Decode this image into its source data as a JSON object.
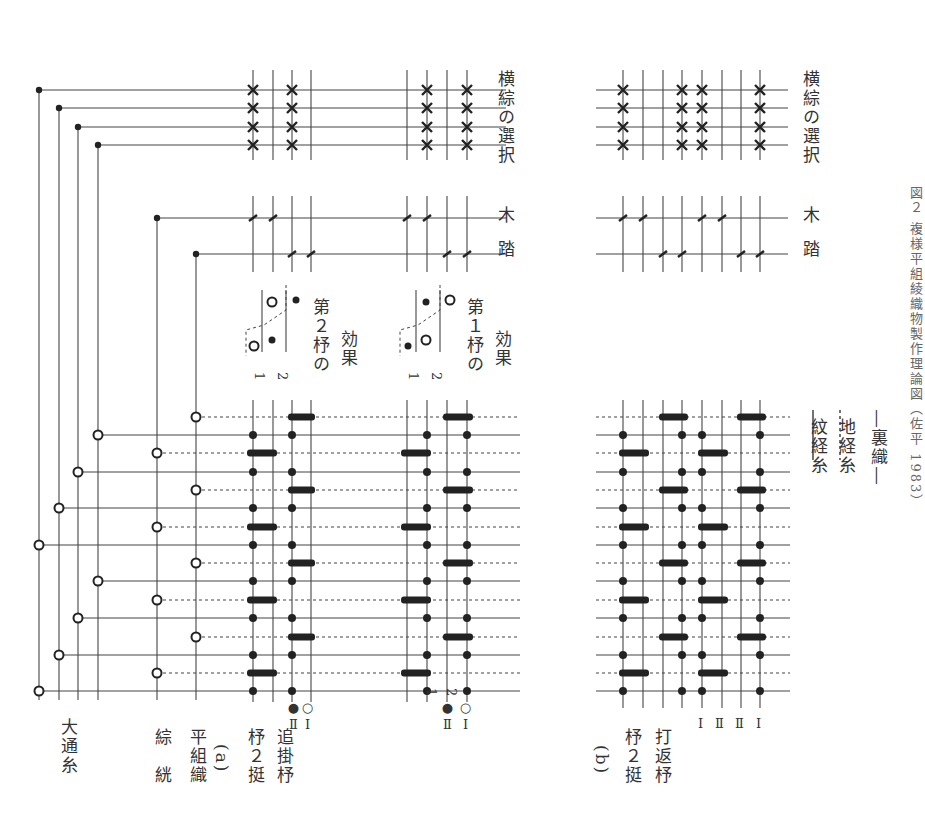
{
  "figure": {
    "caption": "図２ 複様平組綾織物製作理論図（佐平 1983）",
    "orientation": "rotated 90° clockwise"
  },
  "labels": {
    "odori_ito": "大通糸",
    "sou_sou": "綜　絖",
    "hira_soshiki": "平組織",
    "part_a": "(a)",
    "hi2tei_a": "杼２挺",
    "oikake_hi": "追掛杼",
    "mark_II_filled": "●Ⅱ",
    "mark_I_open": "○Ⅰ",
    "part_b": "(b)",
    "hi2tei_b": "杼２挺",
    "uchikaeshi_hi": "打返杼",
    "yokosou_select_1": "横綜の選択",
    "yokosou_select_2": "横綜の選択",
    "fumiki_1a": "踏",
    "fumiki_1b": "木",
    "fumiki_2a": "踏",
    "fumiki_2b": "木",
    "effect_2": "第２杼の",
    "effect_2b": "効果",
    "effect_1": "第１杼の",
    "effect_1b": "効果",
    "shed_1": "1",
    "shed_2": "2",
    "col_1": "1",
    "col_2": "2",
    "b_cols": [
      "Ⅰ",
      "Ⅱ",
      "Ⅱ",
      "Ⅰ"
    ]
  },
  "legend": {
    "solid": "紋経糸",
    "dotted": "地経糸",
    "back_weave": "―裏織―"
  },
  "colors": {
    "ink": "#222222",
    "line": "#444444",
    "background": "#ffffff"
  },
  "diagram": {
    "warp_rows_y": [
      417,
      435,
      453,
      472,
      490,
      508,
      527,
      545,
      563,
      581,
      600,
      618,
      637,
      655,
      673,
      691
    ],
    "warp_row_type": [
      "d",
      "s",
      "d",
      "s",
      "d",
      "s",
      "d",
      "s",
      "d",
      "s",
      "d",
      "s",
      "d",
      "s",
      "d",
      "s"
    ],
    "draw_lines_x": [
      39,
      59,
      78,
      98
    ],
    "draw_lines_top_y": [
      90,
      108,
      127,
      145
    ],
    "heddle_x": [
      157,
      196
    ],
    "grid_a1_x": [
      253,
      273,
      292,
      311
    ],
    "grid_a2_x": [
      407,
      427,
      447,
      467
    ],
    "grid_b_x": [
      623,
      643,
      663,
      682,
      702,
      722,
      741,
      760
    ]
  }
}
